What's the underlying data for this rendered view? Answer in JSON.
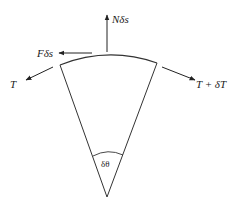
{
  "diagram": {
    "type": "free-body diagram of belt/rope element on curved surface",
    "labels": {
      "normal_force": "Nδs",
      "friction_force": "Fδs",
      "tension_left": "T",
      "tension_right": "T + δT",
      "angle": "δθ"
    },
    "colors": {
      "line": "#333333",
      "background": "#ffffff"
    }
  }
}
